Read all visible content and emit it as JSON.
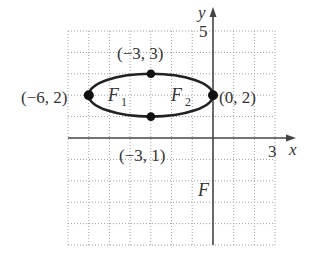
{
  "figure": {
    "type": "coordinate-plane-ellipse",
    "axes": {
      "x_label": "x",
      "y_label": "y",
      "x_tick_label": "3",
      "y_tick_label": "5",
      "x_range": [
        -7,
        3
      ],
      "y_range": [
        -5,
        5
      ],
      "grid_step": 1,
      "grid_style": "dotted"
    },
    "ellipse": {
      "center": [
        -3,
        2
      ],
      "semi_major_x": 3,
      "semi_minor_y": 1,
      "stroke_color": "#222222"
    },
    "points": [
      {
        "name": "left-vertex",
        "coords": [
          -6,
          2
        ],
        "label": "(−6, 2)"
      },
      {
        "name": "right-vertex",
        "coords": [
          0,
          2
        ],
        "label": "(0, 2)"
      },
      {
        "name": "top-covertex",
        "coords": [
          -3,
          3
        ],
        "label": "(−3, 3)"
      },
      {
        "name": "bottom-covertex",
        "coords": [
          -3,
          1
        ],
        "label": "(−3, 1)"
      }
    ],
    "foci_labels": {
      "f1_main": "F",
      "f1_sub": "1",
      "f2_main": "F",
      "f2_sub": "2"
    },
    "extra_label": "F",
    "colors": {
      "axis": "#444444",
      "grid": "#9a9a9a",
      "curve": "#222222",
      "point": "#111111",
      "text": "#333333"
    }
  }
}
